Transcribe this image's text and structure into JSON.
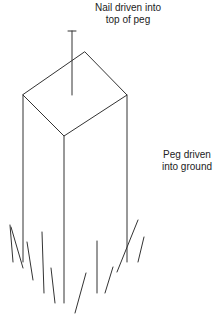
{
  "diagram": {
    "title": "",
    "stroke_color": "#333333",
    "labels": {
      "nail": {
        "line1": "Nail driven into",
        "line2": "top of peg"
      },
      "peg": {
        "line1": "Peg driven",
        "line2": "into ground"
      }
    },
    "shapes": {
      "nail": {
        "head": [
          [
            68,
            31
          ],
          [
            76,
            31
          ]
        ],
        "shaft": [
          [
            72,
            31
          ],
          [
            72,
            95
          ]
        ]
      },
      "peg_top": {
        "points": [
          [
            85,
            52
          ],
          [
            127,
            95
          ],
          [
            64,
            136
          ],
          [
            23,
            95
          ]
        ]
      },
      "peg_edges": {
        "left": [
          [
            23,
            95
          ],
          [
            23,
            262
          ]
        ],
        "front": [
          [
            64,
            136
          ],
          [
            64,
            303
          ]
        ],
        "right": [
          [
            127,
            95
          ],
          [
            127,
            262
          ]
        ]
      },
      "grass_strokes": [
        [
          [
            10,
            225
          ],
          [
            13,
            262
          ]
        ],
        [
          [
            11,
            227
          ],
          [
            23,
            268
          ]
        ],
        [
          [
            27,
            242
          ],
          [
            33,
            280
          ]
        ],
        [
          [
            42,
            232
          ],
          [
            44,
            293
          ]
        ],
        [
          [
            51,
            268
          ],
          [
            55,
            303
          ]
        ],
        [
          [
            86,
            273
          ],
          [
            75,
            313
          ]
        ],
        [
          [
            97,
            241
          ],
          [
            97,
            293
          ]
        ],
        [
          [
            113,
            267
          ],
          [
            105,
            293
          ]
        ],
        [
          [
            138,
            220
          ],
          [
            117,
            272
          ]
        ],
        [
          [
            144,
            237
          ],
          [
            138,
            262
          ]
        ]
      ]
    }
  }
}
